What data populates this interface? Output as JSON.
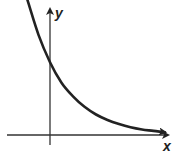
{
  "chart_data": {
    "type": "line",
    "title": "",
    "xlabel": "x",
    "ylabel": "y",
    "series": [
      {
        "name": "exponential decay",
        "x": [
          -1.0,
          -0.5,
          0,
          0.5,
          1,
          1.5,
          2,
          2.5,
          3,
          3.5,
          4,
          4.5,
          5
        ],
        "y": [
          3.0,
          2.2,
          1.6,
          1.15,
          0.85,
          0.62,
          0.45,
          0.33,
          0.24,
          0.17,
          0.12,
          0.09,
          0.06
        ]
      }
    ],
    "grid": false,
    "legend": null,
    "ticks": [],
    "colors": {
      "curve": "#222222",
      "axes": "#333333"
    }
  },
  "labels": {
    "x_axis": "x",
    "y_axis": "y"
  }
}
